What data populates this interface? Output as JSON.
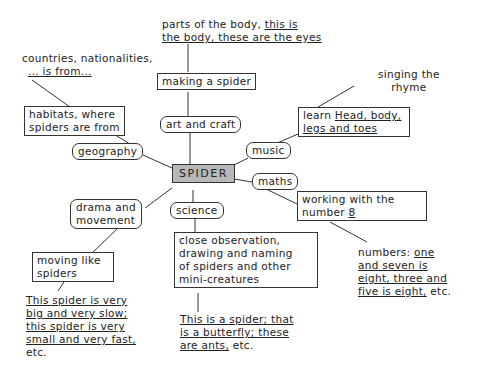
{
  "center": {
    "label": "SPIDER",
    "fill": "#b8b8b8"
  },
  "branches": {
    "art": {
      "topic": "art and craft",
      "activity": "making a spider",
      "language": [
        "parts of the body, ",
        "this is",
        "the body, these are the eyes"
      ]
    },
    "geography": {
      "topic": "geography",
      "activity": [
        "habitats, where",
        "spiders are from"
      ],
      "language": [
        "countries, nationalities,",
        "... is from..."
      ]
    },
    "music": {
      "topic": "music",
      "activity": [
        "learn ",
        "Head, body,",
        "legs and toes"
      ],
      "language": [
        "singing the",
        "rhyme"
      ]
    },
    "maths": {
      "topic": "maths",
      "activity": [
        "working with the",
        "number ",
        "8"
      ],
      "language": [
        "numbers: ",
        "one",
        "and seven is",
        "eight, three and",
        "five is eight,",
        " etc."
      ]
    },
    "drama": {
      "topic": [
        "drama and",
        "movement"
      ],
      "activity": [
        "moving like",
        "spiders"
      ],
      "language": [
        "This spider is very",
        "big and very slow;",
        "this spider is very",
        "small and very fast,",
        "etc."
      ]
    },
    "science": {
      "topic": "science",
      "activity": [
        "close observation,",
        "drawing and naming",
        "of spiders and other",
        "mini-creatures"
      ],
      "language": [
        "This is a spider; that",
        "is a butterfly; these",
        "are ants,",
        " etc."
      ]
    }
  }
}
